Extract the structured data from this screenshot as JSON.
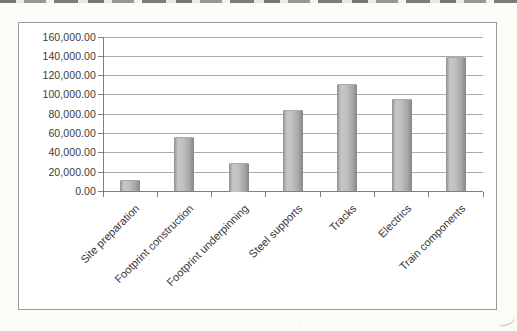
{
  "chart_data": {
    "type": "bar",
    "title": "",
    "xlabel": "",
    "ylabel": "",
    "categories": [
      "Site preparation",
      "Footprint construction",
      "Footprint underpinning",
      "Steel supports",
      "Tracks",
      "Electrics",
      "Train components"
    ],
    "values": [
      12000,
      56000,
      30000,
      84000,
      111000,
      96000,
      139000
    ],
    "ylim": [
      0,
      160000
    ],
    "ytick_step": 20000,
    "ytick_labels_top_to_bottom": [
      "160,000.00",
      "140,000.00",
      "120,000.00",
      "100,000.00",
      "80,000.00",
      "60,000.00",
      "40,000.00",
      "20,000.00",
      "0.00"
    ],
    "grid": true,
    "legend": "none",
    "x_label_rotation_deg": -45,
    "colors": {
      "bar_light": "#c7c7c7",
      "bar_dark": "#878787",
      "gridline": "#8d8d8d",
      "axis": "#7f7f7f",
      "text": "#3b3b3b",
      "chart_background": "#ffffff",
      "chart_border": "#9a9a9a",
      "paper_background": "#fbfbf8"
    }
  }
}
